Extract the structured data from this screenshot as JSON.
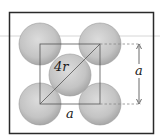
{
  "diagram": {
    "labels": {
      "diagonal": "4r",
      "edge_bottom": "a",
      "edge_right": "a"
    },
    "colors": {
      "frame": "#2a2a2a",
      "atom_fill": "#c8c8c8",
      "atom_edge": "#9a9a9a",
      "lines": "#555555",
      "guide_line": "#d0d0d0"
    },
    "atoms": [
      {
        "id": "top-left",
        "cx": 40,
        "cy": 44,
        "r": 21
      },
      {
        "id": "top-right",
        "cx": 100,
        "cy": 44,
        "r": 21
      },
      {
        "id": "center",
        "cx": 70,
        "cy": 75,
        "r": 21
      },
      {
        "id": "bottom-left",
        "cx": 40,
        "cy": 104,
        "r": 21
      },
      {
        "id": "bottom-right",
        "cx": 100,
        "cy": 104,
        "r": 21
      }
    ]
  }
}
